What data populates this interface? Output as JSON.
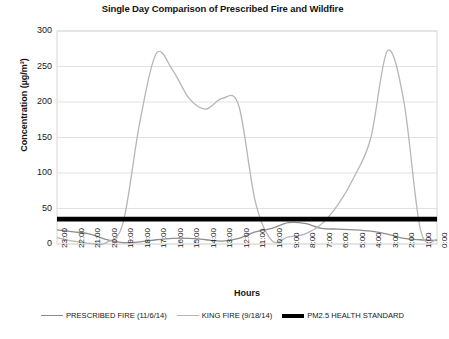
{
  "chart_data": {
    "type": "line",
    "title": "Single Day Comparison of Prescribed Fire and Wildfire",
    "xlabel": "Hours",
    "ylabel": "Concentration (µg/m³)",
    "ylim": [
      0,
      300
    ],
    "yticks": [
      300,
      250,
      200,
      150,
      100,
      50,
      0
    ],
    "grid": true,
    "legend_position": "bottom",
    "categories": [
      "23:00",
      "22:00",
      "21:00",
      "20:00",
      "19:00",
      "18:00",
      "17:00",
      "16:00",
      "15:00",
      "14:00",
      "13:00",
      "12:00",
      "11:00",
      "10:00",
      "9:00",
      "8:00",
      "7:00",
      "6:00",
      "5:00",
      "4:00",
      "3:00",
      "2:00",
      "1:00",
      "0:00"
    ],
    "series": [
      {
        "name": "PRESCRIBED FIRE (11/6/14)",
        "color": "#8d8d8d",
        "values": [
          20,
          17,
          14,
          6,
          2,
          3,
          6,
          8,
          8,
          6,
          4,
          8,
          17,
          22,
          30,
          29,
          22,
          21,
          20,
          18,
          14,
          8,
          6,
          5
        ]
      },
      {
        "name": "KING FIRE (9/18/14)",
        "color": "#b6b6b6",
        "values": [
          9,
          4,
          1,
          2,
          30,
          170,
          268,
          245,
          205,
          190,
          205,
          195,
          60,
          5,
          10,
          14,
          28,
          55,
          95,
          150,
          272,
          200,
          20,
          6
        ]
      },
      {
        "name": "PM2.5 HEALTH STANDARD",
        "color": "#000000",
        "constant_value": 35,
        "values": [
          35,
          35,
          35,
          35,
          35,
          35,
          35,
          35,
          35,
          35,
          35,
          35,
          35,
          35,
          35,
          35,
          35,
          35,
          35,
          35,
          35,
          35,
          35,
          35
        ]
      }
    ]
  },
  "legend": {
    "items": [
      {
        "label": "PRESCRIBED FIRE (11/6/14)",
        "color": "#8d8d8d",
        "weight": "thin"
      },
      {
        "label": "KING FIRE (9/18/14)",
        "color": "#b6b6b6",
        "weight": "thin"
      },
      {
        "label": "PM2.5 HEALTH STANDARD",
        "color": "#000000",
        "weight": "thick"
      }
    ]
  },
  "colors": {
    "prescribed_fire": "#8d8d8d",
    "king_fire": "#b6b6b6",
    "health_standard": "#000000",
    "grid": "#e2e2e2",
    "frame": "#d8d8d8",
    "text": "#141414"
  }
}
